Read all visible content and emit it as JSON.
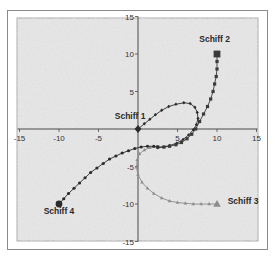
{
  "chart_data": {
    "type": "scatter",
    "title": "",
    "xlabel": "",
    "ylabel": "",
    "xlim": [
      -15,
      15
    ],
    "ylim": [
      -15,
      15
    ],
    "x_ticks": [
      -15,
      -10,
      -5,
      0,
      5,
      10,
      15
    ],
    "y_ticks": [
      -15,
      -10,
      -5,
      0,
      5,
      10,
      15
    ],
    "x_tick_labels": [
      "-15",
      "-10",
      "-5",
      "",
      "5",
      "10",
      "15"
    ],
    "y_tick_labels": [
      "-15",
      "-10",
      "-5",
      "",
      "5",
      "10",
      "15"
    ],
    "grid": false,
    "legend": null,
    "background": "mottled light gray",
    "series": [
      {
        "name": "Schiff 1",
        "marker": "diamond",
        "color": "#2b2b2b",
        "label_at": [
          -1.0,
          1.3
        ],
        "points": [
          [
            0,
            0
          ],
          [
            0.8,
            0.7
          ],
          [
            1.5,
            1.3
          ],
          [
            2.2,
            1.9
          ],
          [
            3.0,
            2.5
          ],
          [
            3.9,
            3.0
          ],
          [
            4.8,
            3.3
          ],
          [
            5.8,
            3.5
          ],
          [
            6.6,
            3.4
          ],
          [
            7.2,
            2.9
          ],
          [
            7.5,
            2.2
          ],
          [
            7.6,
            1.4
          ],
          [
            7.4,
            0.6
          ],
          [
            7.0,
            -0.1
          ],
          [
            6.4,
            -0.8
          ],
          [
            5.7,
            -1.4
          ],
          [
            4.9,
            -1.9
          ],
          [
            4.0,
            -2.2
          ],
          [
            3.2,
            -2.4
          ],
          [
            2.5,
            -2.5
          ]
        ]
      },
      {
        "name": "Schiff 2",
        "marker": "square",
        "color": "#3a3a3a",
        "label_at": [
          9.7,
          11.6
        ],
        "points": [
          [
            10,
            10
          ],
          [
            10,
            9
          ],
          [
            10,
            8
          ],
          [
            9.9,
            7
          ],
          [
            9.7,
            6
          ],
          [
            9.5,
            5
          ],
          [
            9.2,
            4
          ],
          [
            8.8,
            3
          ],
          [
            8.3,
            2
          ],
          [
            7.8,
            1
          ],
          [
            7.3,
            0
          ],
          [
            6.8,
            -0.7
          ],
          [
            6.2,
            -1.3
          ],
          [
            5.5,
            -1.8
          ],
          [
            4.8,
            -2.1
          ],
          [
            4.0,
            -2.3
          ],
          [
            3.3,
            -2.4
          ],
          [
            2.5,
            -2.4
          ]
        ]
      },
      {
        "name": "Schiff 3",
        "marker": "triangle",
        "color": "#8c8c8c",
        "label_at": [
          13.3,
          -10.0
        ],
        "points": [
          [
            10,
            -10
          ],
          [
            9,
            -10
          ],
          [
            8,
            -10
          ],
          [
            7,
            -10
          ],
          [
            6,
            -9.9
          ],
          [
            5,
            -9.8
          ],
          [
            4,
            -9.6
          ],
          [
            3,
            -9.2
          ],
          [
            2,
            -8.6
          ],
          [
            1.2,
            -7.9
          ],
          [
            0.5,
            -7.1
          ],
          [
            0,
            -6.1
          ],
          [
            -0.2,
            -5.1
          ],
          [
            -0.1,
            -4.1
          ],
          [
            0.2,
            -3.3
          ],
          [
            0.8,
            -2.8
          ],
          [
            1.5,
            -2.5
          ],
          [
            2.5,
            -2.4
          ]
        ]
      },
      {
        "name": "Schiff 4",
        "marker": "circle",
        "color": "#2b2b2b",
        "label_at": [
          -10.0,
          -11.3
        ],
        "points": [
          [
            -10,
            -10
          ],
          [
            -9.4,
            -9.3
          ],
          [
            -8.8,
            -8.6
          ],
          [
            -8.1,
            -7.9
          ],
          [
            -7.4,
            -7.2
          ],
          [
            -6.7,
            -6.5
          ],
          [
            -6.0,
            -5.8
          ],
          [
            -5.2,
            -5.2
          ],
          [
            -4.4,
            -4.6
          ],
          [
            -3.6,
            -4.0
          ],
          [
            -2.8,
            -3.6
          ],
          [
            -2.0,
            -3.2
          ],
          [
            -1.2,
            -2.9
          ],
          [
            -0.4,
            -2.6
          ],
          [
            0.4,
            -2.4
          ],
          [
            1.2,
            -2.3
          ],
          [
            2.0,
            -2.3
          ],
          [
            2.5,
            -2.4
          ]
        ]
      }
    ]
  },
  "labels": {
    "schiff1": "Schiff 1",
    "schiff2": "Schiff 2",
    "schiff3": "Schiff 3",
    "schiff4": "Schiff 4"
  },
  "colors": {
    "plot_bg": "#d9d9d9",
    "axis": "#4a4a4a",
    "frame": "#8a8a8a"
  }
}
